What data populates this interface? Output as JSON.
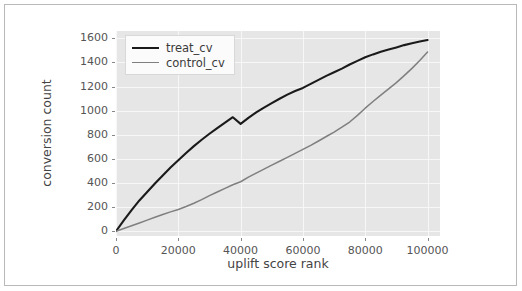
{
  "figure": {
    "background": "#ffffff",
    "border_color": "#b9b9b9",
    "axes_facecolor": "#e6e6e6",
    "grid_color": "#f7f7f7"
  },
  "chart_data": {
    "type": "line",
    "title": "",
    "xlabel": "uplift score rank",
    "ylabel": "conversion count",
    "xlim": [
      0,
      104000
    ],
    "ylim": [
      -40,
      1660
    ],
    "xticks": [
      0,
      20000,
      40000,
      60000,
      80000,
      100000
    ],
    "xtick_labels": [
      "0",
      "20000",
      "40000",
      "60000",
      "80000",
      "100000"
    ],
    "yticks": [
      0,
      200,
      400,
      600,
      800,
      1000,
      1200,
      1400,
      1600
    ],
    "ytick_labels": [
      "0",
      "200",
      "400",
      "600",
      "800",
      "1000",
      "1200",
      "1400",
      "1600"
    ],
    "grid": true,
    "legend_position": "upper left",
    "x": [
      0,
      2500,
      5000,
      7500,
      10000,
      12500,
      15000,
      17500,
      20000,
      22500,
      25000,
      27500,
      30000,
      32500,
      35000,
      37500,
      40000,
      42500,
      45000,
      47500,
      50000,
      52500,
      55000,
      57500,
      60000,
      62500,
      65000,
      67500,
      70000,
      72500,
      75000,
      77500,
      80000,
      82500,
      85000,
      87500,
      90000,
      92500,
      95000,
      97500,
      100000
    ],
    "series": [
      {
        "name": "treat_cv",
        "color": "#1a1a1a",
        "width": 2.1,
        "values": [
          0,
          85,
          165,
          240,
          310,
          380,
          450,
          515,
          580,
          640,
          700,
          755,
          805,
          855,
          900,
          945,
          890,
          945,
          990,
          1030,
          1065,
          1100,
          1135,
          1165,
          1190,
          1225,
          1258,
          1290,
          1320,
          1350,
          1385,
          1415,
          1445,
          1468,
          1490,
          1508,
          1525,
          1545,
          1560,
          1575,
          1585
        ]
      },
      {
        "name": "control_cv",
        "color": "#7f7f7f",
        "width": 1.5,
        "values": [
          0,
          22,
          45,
          68,
          92,
          115,
          138,
          160,
          180,
          205,
          232,
          262,
          295,
          325,
          355,
          385,
          410,
          448,
          482,
          515,
          548,
          580,
          612,
          645,
          678,
          712,
          748,
          785,
          822,
          862,
          905,
          960,
          1020,
          1075,
          1128,
          1180,
          1232,
          1290,
          1350,
          1415,
          1485
        ]
      }
    ],
    "series_corrected": {
      "treat_cv": [
        0,
        90,
        175,
        255,
        325,
        395,
        462,
        528,
        588,
        648,
        705,
        758,
        808,
        855,
        900,
        945,
        890,
        940,
        985,
        1025,
        1062,
        1098,
        1132,
        1162,
        1188,
        1222,
        1255,
        1288,
        1318,
        1348,
        1382,
        1412,
        1442,
        1466,
        1488,
        1506,
        1524,
        1543,
        1558,
        1573,
        1585
      ]
    }
  },
  "legend": {
    "entries": [
      {
        "label": "treat_cv",
        "color": "#1a1a1a"
      },
      {
        "label": "control_cv",
        "color": "#7f7f7f"
      }
    ]
  }
}
